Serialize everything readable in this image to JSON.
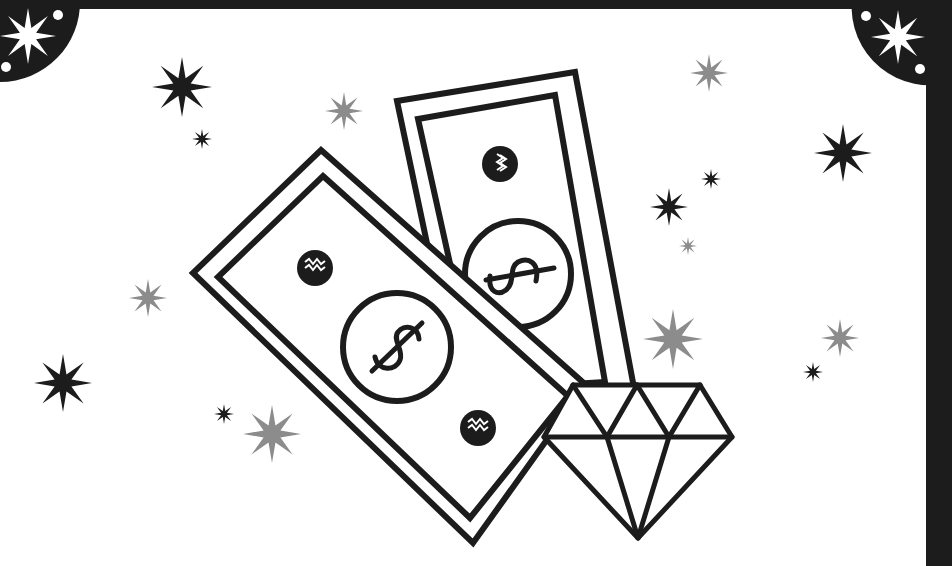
{
  "illustration": {
    "subject": "money and diamond clipart",
    "colors": {
      "ink": "#1c1c1c",
      "background": "#ffffff",
      "frame": "#1c1c1c",
      "star_dark": "#1c1c1c",
      "star_gray": "#8c8c8c",
      "corner_ornament": "#1c1c1c",
      "corner_star": "#ffffff"
    },
    "elements": {
      "front_bill": {
        "symbol": "$",
        "seals": 2
      },
      "back_bill": {
        "symbol": "$",
        "seals": 1
      },
      "diamond": {
        "facets": "brilliant-cut outline"
      },
      "corner_ornaments": [
        "top-left",
        "top-right"
      ],
      "sparkles_dark": 9,
      "sparkles_gray": 7
    }
  }
}
